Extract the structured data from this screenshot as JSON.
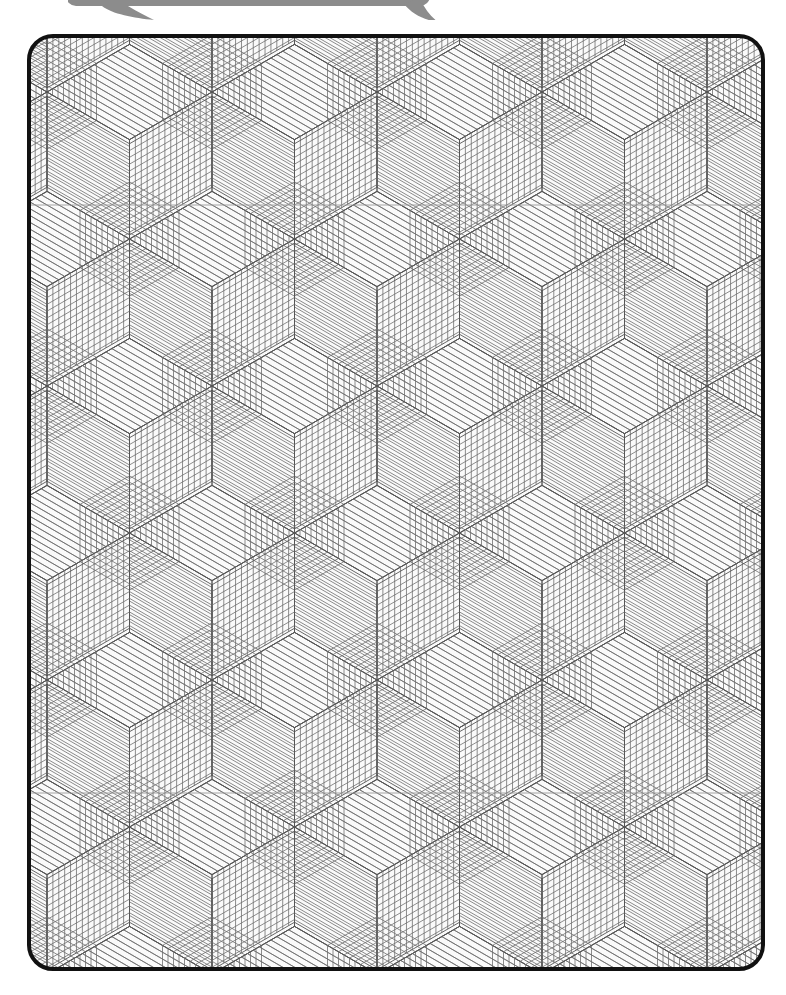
{
  "page": {
    "width": 786,
    "height": 995,
    "background_color": "#ffffff"
  },
  "bubble": {
    "name": "speech-bubble-tail",
    "fill_color": "#8c8c8c",
    "visible_label": ""
  },
  "swatch_card": {
    "name": "pattern-swatch-card",
    "x": 27,
    "y": 34,
    "width": 738,
    "height": 937,
    "corner_radius": 26,
    "border_color": "#111111",
    "border_width": 4,
    "fill_color": "#fafafa"
  },
  "pattern": {
    "name": "isometric-cube-hatch-pattern",
    "type": "seamless-geometric-tiling",
    "motif": "hexagon split into three rhombi (isometric cube) with concentric nested chevrons",
    "hatch_line_color": "#6e6e6e",
    "hatch_line_width": 0.8,
    "structure_line_color": "#555555",
    "structure_line_width": 0.9,
    "guide_line_color": "#9a9a9a",
    "guide_line_width": 0.9,
    "hex_half_width": 82.5,
    "hex_pitch_x": 165,
    "hex_pitch_y": 147,
    "hatch_spacing": 7,
    "nested_rings": 9,
    "guide_lines_y": [
      205,
      793
    ]
  },
  "chart_data": {
    "type": "table",
    "categories": [
      "hex_pitch_x",
      "hex_pitch_y",
      "hatch_spacing",
      "nested_rings"
    ],
    "values": [
      165,
      147,
      7,
      9
    ]
  }
}
